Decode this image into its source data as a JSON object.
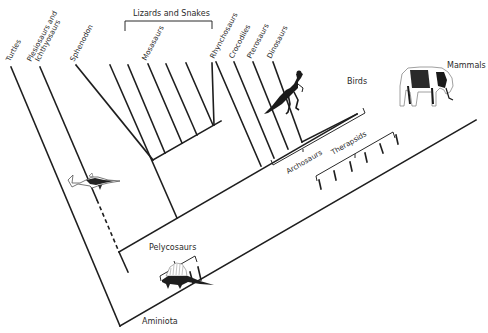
{
  "diagram": {
    "type": "cladogram",
    "root_label": "Aminiota",
    "tip_labels": {
      "turtles": "Turtles",
      "plesiosaurs_line1": "Plesiosaurs and",
      "plesiosaurs_line2": "Ichthyosaurs",
      "sphenodon": "Sphenodon",
      "mosasaurs": "Mosasaurs",
      "rhynchosaurs": "Rhynchosaurs",
      "crocodiles": "Crocodiles",
      "pterosaurs": "Pterosaurs",
      "dinosaurs": "Dinosaurs",
      "birds": "Birds",
      "mammals": "Mammals"
    },
    "group_labels": {
      "lizards_and_snakes": "Lizards and Snakes",
      "archosaurs": "Archosaurs",
      "therapsids": "Therapsids",
      "pelycosaurs": "Pelycosaurs"
    },
    "illustrations": [
      {
        "name": "ichthyosaur-silhouette",
        "label": "ichthyosaur"
      },
      {
        "name": "dinosaur-skeleton",
        "label": "dinosaur"
      },
      {
        "name": "mammoth-skeleton",
        "label": "mammal"
      },
      {
        "name": "dimetrodon-silhouette",
        "label": "pelycosaur"
      }
    ]
  }
}
